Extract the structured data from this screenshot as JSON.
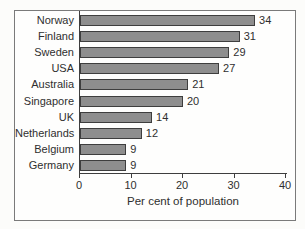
{
  "chart_data": {
    "type": "bar",
    "orientation": "horizontal",
    "title": "",
    "categories": [
      "Norway",
      "Finland",
      "Sweden",
      "USA",
      "Australia",
      "Singapore",
      "UK",
      "Netherlands",
      "Belgium",
      "Germany"
    ],
    "values": [
      34,
      31,
      29,
      27,
      21,
      20,
      14,
      12,
      9,
      9
    ],
    "data_labels": [
      34,
      31,
      29,
      27,
      21,
      20,
      14,
      12,
      9,
      9
    ],
    "xlabel": "Per cent of population",
    "ylabel": "",
    "xlim": [
      0,
      40
    ],
    "xticks": [
      0,
      10,
      20,
      30,
      40
    ],
    "grid": false,
    "legend": false,
    "bar_color": "#8e8e8e",
    "bar_border_color": "#3e3e3e",
    "axis_color": "#3e3e3e",
    "text_color": "#2f2f2f",
    "frame_border_color": "#7a7a7a"
  }
}
